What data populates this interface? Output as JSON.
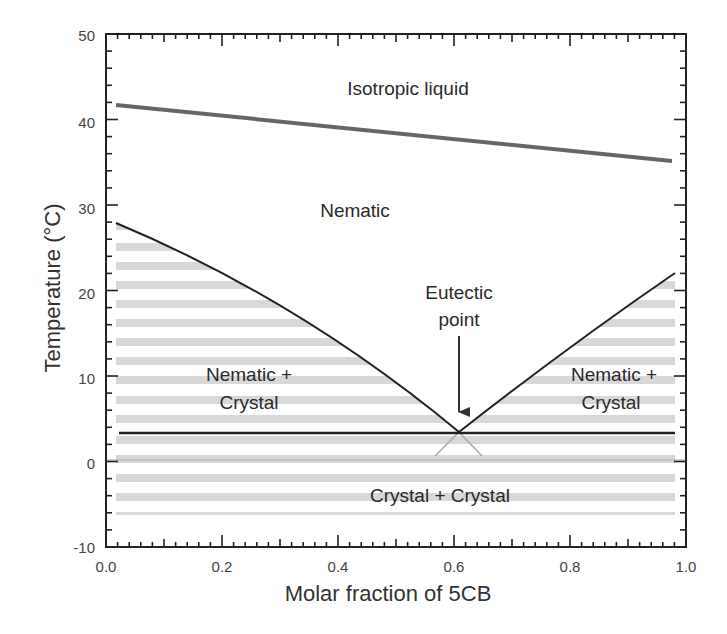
{
  "chart_data": {
    "type": "line",
    "title": "",
    "xlabel": "Molar fraction of 5CB",
    "ylabel": "Temperature (°C)",
    "xlim": [
      0.0,
      1.0
    ],
    "ylim": [
      -10,
      50
    ],
    "x_ticks": [
      "0.0",
      "0.2",
      "0.4",
      "0.6",
      "0.8",
      "1.0"
    ],
    "y_ticks": [
      "-10",
      "0",
      "10",
      "20",
      "30",
      "40",
      "50"
    ],
    "grid": false,
    "legend": null,
    "series": [
      {
        "name": "Nematic-isotropic transition",
        "x": [
          0.02,
          0.98
        ],
        "y": [
          42.0,
          35.5
        ]
      },
      {
        "name": "Left liquidus (nematic/crystal)",
        "x": [
          0.02,
          0.2,
          0.36,
          0.5,
          0.607
        ],
        "y": [
          28.0,
          19.5,
          12.5,
          7.5,
          3.2
        ]
      },
      {
        "name": "Right liquidus (nematic/crystal)",
        "x": [
          0.607,
          0.7,
          0.8,
          0.9,
          0.98
        ],
        "y": [
          3.2,
          8.5,
          13.5,
          18.2,
          22.0
        ]
      },
      {
        "name": "Eutectic line",
        "x": [
          0.02,
          0.98
        ],
        "y": [
          3.2,
          3.2
        ]
      }
    ],
    "annotations": [
      {
        "text": "Isotropic liquid",
        "x": 0.55,
        "y": 43.5
      },
      {
        "text": "Nematic",
        "x": 0.36,
        "y": 30.0
      },
      {
        "text": "Eutectic point",
        "x": 0.607,
        "y": 3.2,
        "arrow": true
      },
      {
        "text": "Nematic + Crystal",
        "x": 0.25,
        "y": 10.0
      },
      {
        "text": "Nematic + Crystal",
        "x": 0.88,
        "y": 10.0
      },
      {
        "text": "Crystal + Crystal",
        "x": 0.6,
        "y": -3.5
      }
    ],
    "eutectic_point": {
      "x": 0.607,
      "y": 3.2
    }
  },
  "labels": {
    "x_title": "Molar fraction of 5CB",
    "y_title": "Temperature (°C)",
    "x_ticks": [
      "0.0",
      "0.2",
      "0.4",
      "0.6",
      "0.8",
      "1.0"
    ],
    "y_ticks": [
      "50",
      "40",
      "30",
      "20",
      "10",
      "0",
      "-10"
    ],
    "isotropic": "Isotropic liquid",
    "nematic": "Nematic",
    "eutectic_line1": "Eutectic",
    "eutectic_line2": "point",
    "nc_left_1": "Nematic +",
    "nc_left_2": "Crystal",
    "nc_right_1": "Nematic +",
    "nc_right_2": "Crystal",
    "cc": "Crystal + Crystal"
  },
  "colors": {
    "stripe": "#d9d9d9",
    "axis": "#222222",
    "curve": "#222222",
    "ni_line": "#666666"
  }
}
